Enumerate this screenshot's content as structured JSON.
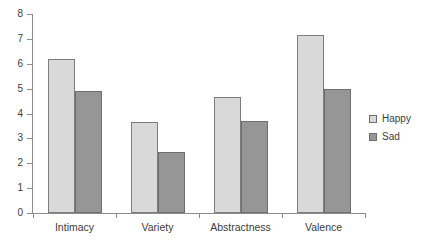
{
  "chart_data": {
    "type": "bar",
    "title": "",
    "subtitle": "",
    "xlabel": "",
    "ylabel": "",
    "categories": [
      "Intimacy",
      "Variety",
      "Abstractness",
      "Valence"
    ],
    "series": [
      {
        "name": "Happy",
        "color": "#d9d9d9",
        "values": [
          6.2,
          3.65,
          4.65,
          7.15
        ]
      },
      {
        "name": "Sad",
        "color": "#969696",
        "values": [
          4.9,
          2.45,
          3.7,
          5.0
        ]
      }
    ],
    "ylim": [
      0,
      8
    ],
    "ytick_step": 1,
    "ytick_labels": [
      "0",
      "1",
      "2",
      "3",
      "4",
      "5",
      "6",
      "7",
      "8"
    ],
    "grid": false,
    "legend_position": "right",
    "legend_entries": [
      "Happy",
      "Sad"
    ]
  }
}
